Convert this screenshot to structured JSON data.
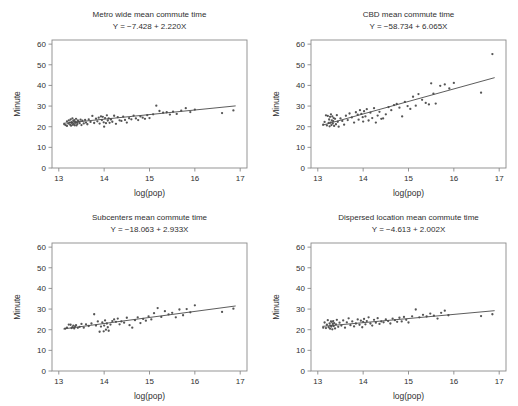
{
  "figure": {
    "width": 518,
    "height": 406,
    "background": "#ffffff",
    "point_color": "#555555",
    "line_color": "#4a4a4a",
    "frame_color": "#8a8a8a",
    "text_color": "#2f2f2f"
  },
  "chart_data": [
    {
      "type": "scatter",
      "panel": "top-left",
      "title": "Metro wide mean commute time",
      "subtitle": "Y = −7.428 + 2.220X",
      "xlabel": "log(pop)",
      "ylabel": "Minute",
      "xlim": [
        12.85,
        17.15
      ],
      "ylim": [
        0,
        62
      ],
      "xticks": [
        13,
        14,
        15,
        16,
        17
      ],
      "yticks": [
        0,
        10,
        20,
        30,
        40,
        50,
        60
      ],
      "grid": false,
      "legend": "none",
      "fit": {
        "intercept": -7.428,
        "slope": 2.22,
        "x_start": 13.1,
        "x_end": 16.9
      },
      "x": [
        13.12,
        13.15,
        13.18,
        13.18,
        13.21,
        13.22,
        13.24,
        13.25,
        13.26,
        13.27,
        13.28,
        13.29,
        13.3,
        13.31,
        13.32,
        13.33,
        13.34,
        13.35,
        13.36,
        13.37,
        13.38,
        13.39,
        13.4,
        13.41,
        13.42,
        13.44,
        13.46,
        13.48,
        13.5,
        13.52,
        13.55,
        13.58,
        13.6,
        13.63,
        13.66,
        13.7,
        13.74,
        13.78,
        13.82,
        13.85,
        13.88,
        13.9,
        13.93,
        13.95,
        13.97,
        13.99,
        14.0,
        14.02,
        14.04,
        14.06,
        14.08,
        14.1,
        14.12,
        14.15,
        14.18,
        14.22,
        14.26,
        14.3,
        14.34,
        14.38,
        14.42,
        14.46,
        14.5,
        14.55,
        14.6,
        14.65,
        14.7,
        14.75,
        14.8,
        14.85,
        14.9,
        14.95,
        15.0,
        15.08,
        15.15,
        15.22,
        15.3,
        15.38,
        15.45,
        15.52,
        15.6,
        15.7,
        15.8,
        15.9,
        16.0,
        16.6,
        16.85
      ],
      "y": [
        21.2,
        20.8,
        22.6,
        20.4,
        21.5,
        23.1,
        22.0,
        21.0,
        23.5,
        20.5,
        22.2,
        21.8,
        24.0,
        20.9,
        22.8,
        21.4,
        23.2,
        20.7,
        22.4,
        21.9,
        23.8,
        20.6,
        22.1,
        21.3,
        23.0,
        22.5,
        21.7,
        23.4,
        20.8,
        22.9,
        21.6,
        23.3,
        22.0,
        21.2,
        23.6,
        22.3,
        25.2,
        21.8,
        23.9,
        22.6,
        24.4,
        21.5,
        25.0,
        23.2,
        24.8,
        22.1,
        20.0,
        24.2,
        21.7,
        25.5,
        23.0,
        24.0,
        21.9,
        23.5,
        22.4,
        25.3,
        21.4,
        24.6,
        23.1,
        22.8,
        24.9,
        23.3,
        22.0,
        24.1,
        23.6,
        25.4,
        24.0,
        23.2,
        25.0,
        24.4,
        23.8,
        25.6,
        24.2,
        26.0,
        30.2,
        27.6,
        26.8,
        27.0,
        25.9,
        27.3,
        26.2,
        27.8,
        29.0,
        27.1,
        28.3,
        26.6,
        27.9
      ]
    },
    {
      "type": "scatter",
      "panel": "top-right",
      "title": "CBD mean commute time",
      "subtitle": "Y = −58.734 + 6.065X",
      "xlabel": "log(pop)",
      "ylabel": "Minute",
      "xlim": [
        12.85,
        17.15
      ],
      "ylim": [
        0,
        62
      ],
      "xticks": [
        13,
        14,
        15,
        16,
        17
      ],
      "yticks": [
        0,
        10,
        20,
        30,
        40,
        50,
        60
      ],
      "grid": false,
      "legend": "none",
      "fit": {
        "intercept": -58.734,
        "slope": 6.065,
        "x_start": 13.1,
        "x_end": 16.9
      },
      "x": [
        13.12,
        13.15,
        13.18,
        13.2,
        13.22,
        13.24,
        13.25,
        13.26,
        13.27,
        13.28,
        13.29,
        13.3,
        13.31,
        13.32,
        13.33,
        13.34,
        13.35,
        13.36,
        13.38,
        13.4,
        13.42,
        13.44,
        13.46,
        13.5,
        13.54,
        13.58,
        13.62,
        13.66,
        13.7,
        13.75,
        13.8,
        13.84,
        13.88,
        13.9,
        13.93,
        13.96,
        13.99,
        14.0,
        14.02,
        14.05,
        14.08,
        14.12,
        14.16,
        14.2,
        14.24,
        14.28,
        14.32,
        14.36,
        14.4,
        14.44,
        14.5,
        14.56,
        14.62,
        14.68,
        14.74,
        14.8,
        14.86,
        14.92,
        14.98,
        15.04,
        15.1,
        15.16,
        15.22,
        15.3,
        15.38,
        15.45,
        15.5,
        15.55,
        15.6,
        15.7,
        15.8,
        15.9,
        16.0,
        16.6,
        16.85
      ],
      "y": [
        21.0,
        22.3,
        25.5,
        20.6,
        25.2,
        21.8,
        23.5,
        20.2,
        24.8,
        22.0,
        26.0,
        20.8,
        23.0,
        25.0,
        21.5,
        22.7,
        24.2,
        20.4,
        23.8,
        21.2,
        25.6,
        22.4,
        20.0,
        24.0,
        22.8,
        21.0,
        25.3,
        23.2,
        26.4,
        24.5,
        22.0,
        27.0,
        25.8,
        23.4,
        28.0,
        26.2,
        24.6,
        22.5,
        27.5,
        25.0,
        28.5,
        23.0,
        26.8,
        24.2,
        29.0,
        22.0,
        25.4,
        27.2,
        23.8,
        24.0,
        26.0,
        29.5,
        28.0,
        30.5,
        31.0,
        29.2,
        25.0,
        32.0,
        30.0,
        28.6,
        34.5,
        30.2,
        35.8,
        33.0,
        31.5,
        30.8,
        41.0,
        36.0,
        31.2,
        39.8,
        40.5,
        38.5,
        41.2,
        36.5,
        55.2
      ]
    },
    {
      "type": "scatter",
      "panel": "bottom-left",
      "title": "Subcenters mean commute time",
      "subtitle": "Y = −18.063 + 2.933X",
      "xlabel": "log(pop)",
      "ylabel": "Minute",
      "xlim": [
        12.85,
        17.15
      ],
      "ylim": [
        0,
        62
      ],
      "xticks": [
        13,
        14,
        15,
        16,
        17
      ],
      "yticks": [
        0,
        10,
        20,
        30,
        40,
        50,
        60
      ],
      "grid": false,
      "legend": "none",
      "fit": {
        "intercept": -18.063,
        "slope": 2.933,
        "x_start": 13.1,
        "x_end": 16.9
      },
      "x": [
        13.14,
        13.18,
        13.22,
        13.26,
        13.28,
        13.3,
        13.32,
        13.34,
        13.36,
        13.38,
        13.42,
        13.46,
        13.5,
        13.55,
        13.6,
        13.66,
        13.72,
        13.78,
        13.82,
        13.86,
        13.9,
        13.93,
        13.96,
        13.99,
        14.0,
        14.02,
        14.04,
        14.06,
        14.08,
        14.1,
        14.14,
        14.18,
        14.22,
        14.26,
        14.3,
        14.34,
        14.38,
        14.44,
        14.5,
        14.56,
        14.62,
        14.68,
        14.74,
        14.8,
        14.86,
        14.92,
        14.98,
        15.04,
        15.1,
        15.18,
        15.26,
        15.34,
        15.42,
        15.5,
        15.58,
        15.66,
        15.74,
        15.82,
        15.9,
        16.0,
        16.6,
        16.85
      ],
      "y": [
        20.5,
        21.0,
        22.5,
        22.4,
        20.8,
        21.2,
        22.0,
        20.6,
        21.6,
        22.2,
        20.9,
        21.4,
        22.8,
        21.0,
        22.6,
        21.8,
        23.0,
        27.5,
        22.0,
        24.0,
        19.0,
        21.5,
        23.5,
        19.2,
        22.0,
        24.5,
        20.0,
        23.0,
        21.2,
        19.5,
        22.5,
        24.2,
        25.0,
        23.8,
        25.4,
        22.6,
        24.0,
        23.4,
        25.8,
        22.2,
        21.0,
        24.6,
        26.0,
        23.2,
        25.2,
        24.4,
        26.5,
        25.0,
        28.0,
        30.5,
        26.2,
        29.0,
        27.4,
        28.2,
        26.0,
        29.8,
        27.0,
        30.0,
        28.4,
        31.8,
        28.6,
        30.2
      ]
    },
    {
      "type": "scatter",
      "panel": "bottom-right",
      "title": "Dispersed location mean commute time",
      "subtitle": "Y = −4.613 + 2.002X",
      "xlabel": "log(pop)",
      "ylabel": "Minute",
      "xlim": [
        12.85,
        17.15
      ],
      "ylim": [
        0,
        62
      ],
      "xticks": [
        13,
        14,
        15,
        16,
        17
      ],
      "yticks": [
        0,
        10,
        20,
        30,
        40,
        50,
        60
      ],
      "grid": false,
      "legend": "none",
      "fit": {
        "intercept": -4.613,
        "slope": 2.002,
        "x_start": 13.1,
        "x_end": 16.9
      },
      "x": [
        13.12,
        13.15,
        13.18,
        13.2,
        13.22,
        13.24,
        13.26,
        13.27,
        13.28,
        13.29,
        13.3,
        13.31,
        13.32,
        13.33,
        13.34,
        13.35,
        13.36,
        13.38,
        13.4,
        13.42,
        13.45,
        13.48,
        13.52,
        13.56,
        13.6,
        13.64,
        13.68,
        13.72,
        13.76,
        13.8,
        13.84,
        13.88,
        13.92,
        13.95,
        13.98,
        14.0,
        14.02,
        14.05,
        14.08,
        14.12,
        14.16,
        14.2,
        14.24,
        14.28,
        14.32,
        14.36,
        14.4,
        14.45,
        14.5,
        14.55,
        14.6,
        14.65,
        14.7,
        14.75,
        14.8,
        14.85,
        14.9,
        14.95,
        15.0,
        15.08,
        15.16,
        15.24,
        15.32,
        15.4,
        15.48,
        15.56,
        15.64,
        15.72,
        15.8,
        15.88,
        16.6,
        16.85
      ],
      "y": [
        21.0,
        23.5,
        20.8,
        22.4,
        24.6,
        21.2,
        23.0,
        20.5,
        22.0,
        24.0,
        21.5,
        23.8,
        20.2,
        22.8,
        24.2,
        21.8,
        23.2,
        20.6,
        22.6,
        24.8,
        21.4,
        23.4,
        22.0,
        24.5,
        21.0,
        23.6,
        25.5,
        22.2,
        24.0,
        21.6,
        23.0,
        25.0,
        22.4,
        24.4,
        21.2,
        23.8,
        25.2,
        22.6,
        24.2,
        26.0,
        23.0,
        22.0,
        24.8,
        23.4,
        25.6,
        22.8,
        24.0,
        23.6,
        25.0,
        24.2,
        23.0,
        25.4,
        24.6,
        23.8,
        25.8,
        24.0,
        26.2,
        24.8,
        23.5,
        26.5,
        29.8,
        26.0,
        27.2,
        26.4,
        27.8,
        26.8,
        25.4,
        28.2,
        29.2,
        27.0,
        26.6,
        27.5
      ]
    }
  ]
}
